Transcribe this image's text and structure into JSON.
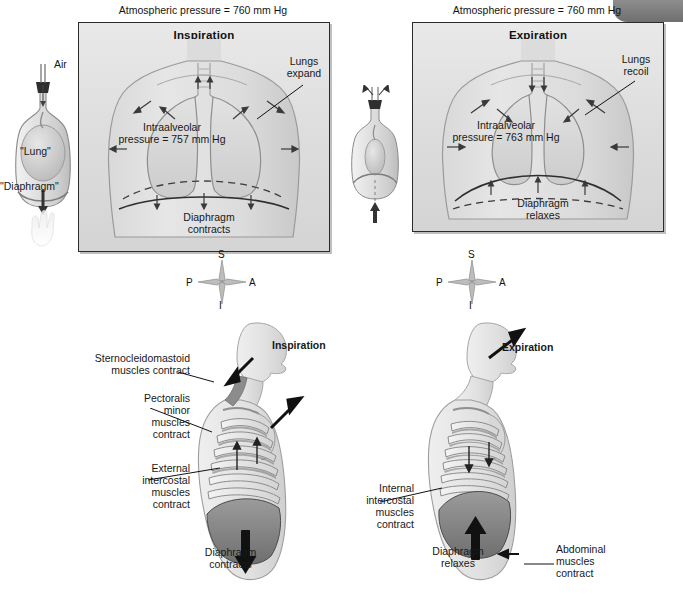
{
  "figure": {
    "top_left_panel": {
      "atmospheric_label": "Atmospheric pressure = 760 mm Hg",
      "title": "Inspiration",
      "lungs_label_line1": "Lungs",
      "lungs_label_line2": "expand",
      "intraalveolar_line1": "Intraalveolar",
      "intraalveolar_line2": "pressure = 757 mm Hg",
      "diaphragm_line1": "Diaphragm",
      "diaphragm_line2": "contracts"
    },
    "top_right_panel": {
      "atmospheric_label": "Atmospheric pressure = 760 mm Hg",
      "title": "Expiration",
      "lungs_label_line1": "Lungs",
      "lungs_label_line2": "recoil",
      "intraalveolar_line1": "Intraalveolar",
      "intraalveolar_line2": "pressure = 763 mm Hg",
      "diaphragm_line1": "Diaphragm",
      "diaphragm_line2": "relaxes"
    },
    "bell_jar_left": {
      "air_label": "Air",
      "lung_label": "\"Lung\"",
      "diaphragm_label": "\"Diaphragm\""
    },
    "bell_jar_middle": {},
    "compass_left": {
      "superior": "S",
      "posterior": "P",
      "anterior": "A",
      "inferior": "I"
    },
    "compass_right": {
      "superior": "S",
      "posterior": "P",
      "anterior": "A",
      "inferior": "I"
    },
    "bottom_left_figure": {
      "title": "Inspiration",
      "sternocleidomastoid_line1": "Sternocleidomastoid",
      "sternocleidomastoid_line2": "muscles contract",
      "pectoralis_line1": "Pectoralis",
      "pectoralis_line2": "minor",
      "pectoralis_line3": "muscles",
      "pectoralis_line4": "contract",
      "external_intercostal_line1": "External",
      "external_intercostal_line2": "intercostal",
      "external_intercostal_line3": "muscles",
      "external_intercostal_line4": "contract",
      "diaphragm_line1": "Diaphragm",
      "diaphragm_line2": "contracts"
    },
    "bottom_right_figure": {
      "title": "Expiration",
      "internal_intercostal_line1": "Internal",
      "internal_intercostal_line2": "intercostal",
      "internal_intercostal_line3": "muscles",
      "internal_intercostal_line4": "contract",
      "diaphragm_line1": "Diaphragm",
      "diaphragm_line2": "relaxes",
      "abdominal_line1": "Abdominal",
      "abdominal_line2": "muscles",
      "abdominal_line3": "contract"
    }
  },
  "colors": {
    "panel_border": "#2b2b2b",
    "panel_fill": "#dedede",
    "text": "#181818",
    "muscle_dark": "#5e5e5e",
    "diaphragm_fill": "#8a8a8a",
    "corner_tab": "#6f6f6f"
  }
}
